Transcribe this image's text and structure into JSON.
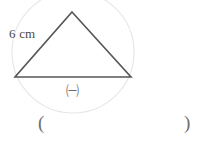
{
  "figure": {
    "type": "geometry-diagram",
    "canvas": {
      "width": 204,
      "height": 142,
      "background": "#ffffff"
    },
    "colors": {
      "triangle_stroke": "#555555",
      "circle_stroke": "#e6e6e6",
      "text": "#4a4a4a",
      "marker_text": "#6b6b6b",
      "paren_text": "#6e6e6e"
    },
    "triangle": {
      "stroke_width": 1.6,
      "vertices": [
        {
          "name": "apex",
          "x": 72,
          "y": 12
        },
        {
          "name": "bottom-right",
          "x": 131,
          "y": 77
        },
        {
          "name": "bottom-left",
          "x": 15,
          "y": 77
        }
      ]
    },
    "circumcircle": {
      "cx": 73,
      "cy": 52,
      "r": 61,
      "stroke_width": 1.1
    },
    "labels": {
      "side_length": "6 cm",
      "base_marker": "㈠"
    },
    "answer_blank": {
      "open_paren": "(",
      "close_paren": ")"
    }
  }
}
